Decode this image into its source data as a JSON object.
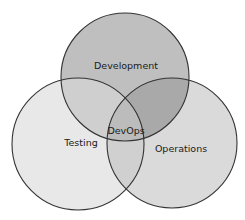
{
  "diagram": {
    "type": "venn",
    "sets": [
      {
        "id": "development",
        "label": "Development",
        "fill": "#bdbdbd"
      },
      {
        "id": "testing",
        "label": "Testing",
        "fill": "#e6e6e6"
      },
      {
        "id": "operations",
        "label": "Operations",
        "fill": "#d9d9d9"
      }
    ],
    "center_label": "DevOps",
    "stroke": "#333333"
  }
}
